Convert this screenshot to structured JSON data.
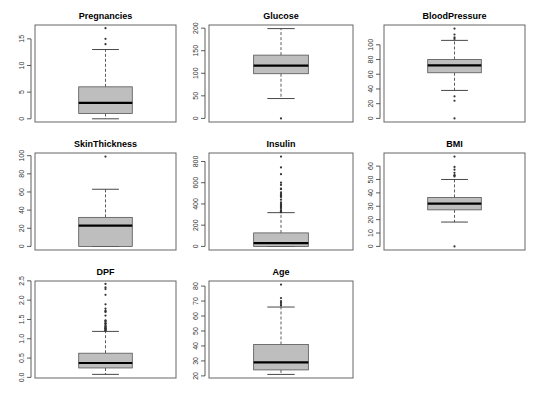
{
  "chart_data": [
    {
      "type": "boxplot",
      "title": "Pregnancies",
      "ylim": [
        -0.6,
        17.6
      ],
      "yticks": [
        0,
        5,
        10,
        15
      ],
      "ytick_labels": [
        "0",
        "5",
        "10",
        "15"
      ],
      "stats": {
        "whisker_low": 0,
        "q1": 1,
        "median": 3,
        "q3": 6,
        "whisker_high": 13
      },
      "outliers": [
        14,
        15,
        17
      ]
    },
    {
      "type": "boxplot",
      "title": "Glucose",
      "ylim": [
        -8,
        207
      ],
      "yticks": [
        0,
        50,
        100,
        150,
        200
      ],
      "ytick_labels": [
        "0",
        "50",
        "100",
        "150",
        "200"
      ],
      "stats": {
        "whisker_low": 44,
        "q1": 99,
        "median": 117,
        "q3": 140.25,
        "whisker_high": 199
      },
      "outliers": [
        0
      ]
    },
    {
      "type": "boxplot",
      "title": "BloodPressure",
      "ylim": [
        -4.9,
        126.9
      ],
      "yticks": [
        0,
        20,
        40,
        60,
        80,
        100
      ],
      "ytick_labels": [
        "0",
        "20",
        "40",
        "60",
        "80",
        "100"
      ],
      "stats": {
        "whisker_low": 38,
        "q1": 62,
        "median": 72,
        "q3": 80,
        "whisker_high": 106
      },
      "outliers": [
        0,
        24,
        30,
        108,
        110,
        114,
        122
      ]
    },
    {
      "type": "boxplot",
      "title": "SkinThickness",
      "ylim": [
        -3.96,
        102.96
      ],
      "yticks": [
        0,
        20,
        40,
        60,
        80,
        100
      ],
      "ytick_labels": [
        "0",
        "20",
        "40",
        "60",
        "80",
        "100"
      ],
      "stats": {
        "whisker_low": 0,
        "q1": 0,
        "median": 23,
        "q3": 32,
        "whisker_high": 63
      },
      "outliers": [
        99
      ]
    },
    {
      "type": "boxplot",
      "title": "Insulin",
      "ylim": [
        -33.84,
        879.84
      ],
      "yticks": [
        0,
        200,
        400,
        600,
        800
      ],
      "ytick_labels": [
        "0",
        "200",
        "400",
        "600",
        "800"
      ],
      "stats": {
        "whisker_low": 0,
        "q1": 0,
        "median": 30.5,
        "q3": 127.25,
        "whisker_high": 318
      },
      "outliers": [
        321,
        325,
        326,
        328,
        330,
        335,
        342,
        360,
        370,
        375,
        387,
        392,
        402,
        415,
        440,
        465,
        474,
        478,
        480,
        485,
        495,
        510,
        540,
        543,
        545,
        579,
        600,
        680,
        744,
        846
      ]
    },
    {
      "type": "boxplot",
      "title": "BMI",
      "ylim": [
        -2.68,
        69.78
      ],
      "yticks": [
        0,
        10,
        20,
        30,
        40,
        50,
        60
      ],
      "ytick_labels": [
        "0",
        "10",
        "20",
        "30",
        "40",
        "50",
        "60"
      ],
      "stats": {
        "whisker_low": 18.2,
        "q1": 27.3,
        "median": 32,
        "q3": 36.6,
        "whisker_high": 50
      },
      "outliers": [
        0,
        52.3,
        52.9,
        53.2,
        55,
        57.3,
        59.4,
        67.1
      ]
    },
    {
      "type": "boxplot",
      "title": "DPF",
      "ylim": [
        -0.016,
        2.496
      ],
      "yticks": [
        0.0,
        0.5,
        1.0,
        1.5,
        2.0,
        2.5
      ],
      "ytick_labels": [
        "0.0",
        "0.5",
        "1.0",
        "1.5",
        "2.0",
        "2.5"
      ],
      "stats": {
        "whisker_low": 0.078,
        "q1": 0.244,
        "median": 0.3725,
        "q3": 0.626,
        "whisker_high": 1.191
      },
      "outliers": [
        1.213,
        1.222,
        1.224,
        1.251,
        1.258,
        1.268,
        1.282,
        1.292,
        1.318,
        1.321,
        1.353,
        1.39,
        1.394,
        1.4,
        1.441,
        1.461,
        1.476,
        1.6,
        1.698,
        1.699,
        1.731,
        1.781,
        1.893,
        2.137,
        2.288,
        2.329,
        2.42
      ]
    },
    {
      "type": "boxplot",
      "title": "Age",
      "ylim": [
        18.6,
        83.4
      ],
      "yticks": [
        20,
        30,
        40,
        50,
        60,
        70,
        80
      ],
      "ytick_labels": [
        "20",
        "30",
        "40",
        "50",
        "60",
        "70",
        "80"
      ],
      "stats": {
        "whisker_low": 21,
        "q1": 24,
        "median": 29,
        "q3": 41,
        "whisker_high": 66
      },
      "outliers": [
        67,
        68,
        69,
        70,
        72,
        81
      ]
    }
  ],
  "layout": {
    "columns": 3,
    "panels": [
      {
        "x0": 35,
        "x1": 176,
        "y0": 25,
        "y1": 122
      },
      {
        "x0": 209,
        "x1": 353,
        "y0": 25,
        "y1": 122
      },
      {
        "x0": 384,
        "x1": 525,
        "y0": 25,
        "y1": 122
      },
      {
        "x0": 35,
        "x1": 176,
        "y0": 153,
        "y1": 250
      },
      {
        "x0": 209,
        "x1": 353,
        "y0": 153,
        "y1": 250
      },
      {
        "x0": 384,
        "x1": 525,
        "y0": 153,
        "y1": 250
      },
      {
        "x0": 35,
        "x1": 176,
        "y0": 281,
        "y1": 378
      },
      {
        "x0": 209,
        "x1": 353,
        "y0": 281,
        "y1": 378
      }
    ]
  },
  "colors": {
    "box_fill": "#bebebe",
    "box_stroke": "#555555",
    "median": "#000000",
    "whisker": "#333333",
    "frame": "#666666",
    "outlier": "#333333"
  }
}
